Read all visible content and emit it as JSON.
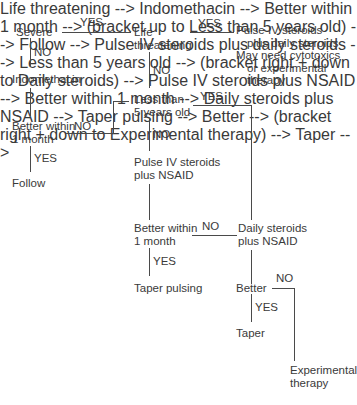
{
  "diagram": {
    "ink_color": "#3a3a3a",
    "line_color": "#4a4a4a",
    "background": "#ffffff",
    "nodes": {
      "severe": "Severe",
      "indomethacin": "Indomethacin",
      "better_within_1_month_left_l1": "Better within",
      "better_within_1_month_left_l2": "1 month",
      "follow": "Follow",
      "life_threatening_l1": "Life",
      "life_threatening_l2": "threatening",
      "less_than_5_years_l1": "Less than",
      "less_than_5_years_l2": "5 years old",
      "pulse_iv_nsaid_l1": "Pulse IV steroids",
      "pulse_iv_nsaid_l2": "plus NSAID",
      "better_within_1_month_mid_l1": "Better within",
      "better_within_1_month_mid_l2": "1 month",
      "taper_pulsing": "Taper pulsing",
      "pulse_iv_daily_l1": "Pulse IV steroids",
      "pulse_iv_daily_l2": "plus daily steroids",
      "pulse_iv_daily_l3": "May need cytotoxics",
      "pulse_iv_daily_l4": "or experimental",
      "pulse_iv_daily_l5": "therapy",
      "daily_steroids_l1": "Daily steroids",
      "daily_steroids_l2": "plus NSAID",
      "better_right": "Better",
      "taper": "Taper",
      "experimental_l1": "Experimental",
      "experimental_l2": "therapy"
    },
    "edges": {
      "severe_to_life_threatening": "YES",
      "severe_to_indomethacin": "NO",
      "better_left_to_follow": "YES",
      "better_left_to_less_than_5": "NO",
      "life_threatening_to_pulse_iv_daily": "YES",
      "life_threatening_to_less_than_5": "NO",
      "less_than_5_to_daily_steroids": "YES",
      "less_than_5_to_pulse_iv_nsaid": "NO",
      "better_mid_to_taper_pulsing": "YES",
      "better_mid_to_daily_steroids": "NO",
      "better_right_to_taper": "YES",
      "better_right_to_experimental": "NO"
    }
  }
}
